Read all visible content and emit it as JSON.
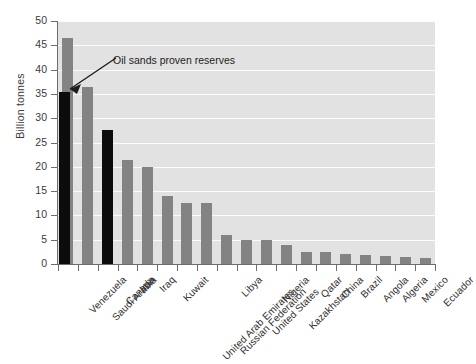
{
  "chart_data": {
    "type": "bar",
    "title": "",
    "subtitle": "",
    "xlabel": "",
    "ylabel": "Billion tonnes",
    "ylim": [
      0,
      50
    ],
    "yticks": [
      0,
      5,
      10,
      15,
      20,
      25,
      30,
      35,
      40,
      45,
      50
    ],
    "ytick_labels": [
      "0",
      "5",
      "10",
      "15",
      "20",
      "25",
      "30",
      "35",
      "40",
      "45",
      "50"
    ],
    "grid": "horizontal",
    "legend": "none",
    "categories": [
      "Venezuela",
      "Saudi Arabia",
      "Canada",
      "Iran",
      "Iraq",
      "Kuwait",
      "United Arab Emirates",
      "Russian Federation",
      "Libya",
      "United States",
      "Nigeria",
      "Kazakhstan",
      "Qatar",
      "China",
      "Brazil",
      "Angola",
      "Algeria",
      "Mexico",
      "Ecuador"
    ],
    "values": [
      46.5,
      36.5,
      27.5,
      21.5,
      20,
      14,
      12.5,
      12.5,
      6,
      5,
      5,
      4,
      2.5,
      2.5,
      2,
      1.8,
      1.7,
      1.5,
      1.3
    ],
    "bar_colors": [
      "#838383",
      "#838383",
      "#0c0c0c",
      "#838383",
      "#838383",
      "#838383",
      "#838383",
      "#838383",
      "#838383",
      "#838383",
      "#838383",
      "#838383",
      "#838383",
      "#838383",
      "#838383",
      "#838383",
      "#838383",
      "#838383",
      "#838383"
    ],
    "overlay_series": {
      "name": "Oil sands proven reserves",
      "points": [
        {
          "category": "Venezuela",
          "value": 35.5,
          "color": "#0c0c0c"
        }
      ]
    },
    "annotations": [
      {
        "text": "Oil sands proven reserves",
        "points_to_category": "Venezuela",
        "points_to_value": 35.5
      }
    ],
    "colors": {
      "bar": "#838383",
      "bar_highlight": "#0c0c0c",
      "plot_background": "#e2e2e2",
      "gridline": "#fbfbfb",
      "axis": "#6d6d6d",
      "text": "#2f2f2f"
    }
  }
}
